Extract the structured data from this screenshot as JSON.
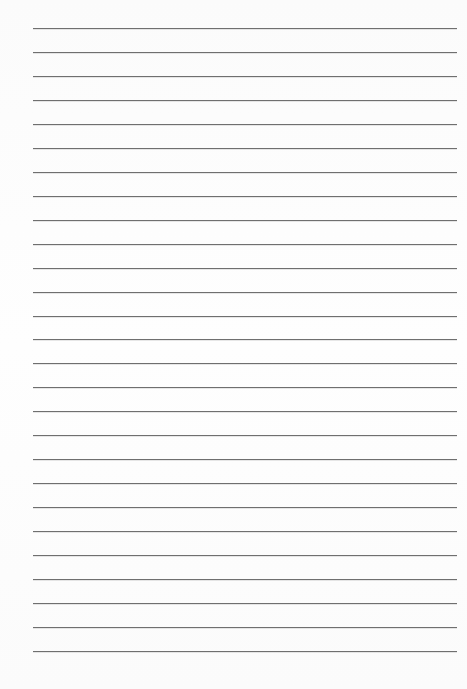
{
  "paper": {
    "type": "lined-paper",
    "background_color": "#fdfdfd",
    "line_color": "#6f6f6f",
    "line_count": 27,
    "first_line_y": 28,
    "line_spacing": 23.96,
    "line_left": 33,
    "line_right": 457
  }
}
